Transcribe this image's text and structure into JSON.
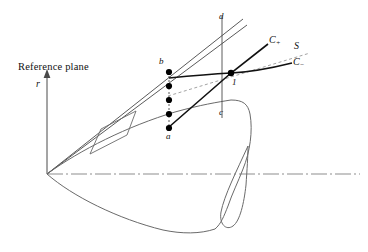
{
  "figure": {
    "title_text": "Reference plane",
    "background_color": "#ffffff",
    "line_color": "#1a1a1a",
    "thin_line_color": "#555555",
    "dashed_color": "#888888"
  },
  "labels": {
    "reference_plane": "Reference plane",
    "r_axis": "r",
    "point_a": "a",
    "point_b": "b",
    "point_c": "c",
    "point_d": "d",
    "point_one": "1",
    "c_plus_base": "C",
    "c_plus_sub": "+",
    "c_minus_base": "C",
    "c_minus_sub": "−",
    "streamline_s": "S"
  },
  "geometry": {
    "apex": [
      47,
      174
    ],
    "axis_y": 174,
    "vertical_axis_top": 74,
    "dot_chain_x": 169,
    "dot_chain_top_y": 72,
    "dot_chain_bottom_y": 128,
    "dot_count": 5,
    "intersection_point": [
      231,
      73
    ],
    "vertical_line_x": 222,
    "vertical_line_top_y": 16,
    "vertical_line_bottom_y": 118
  },
  "icons": {
    "axis_arrow": "arrow-up-icon"
  }
}
